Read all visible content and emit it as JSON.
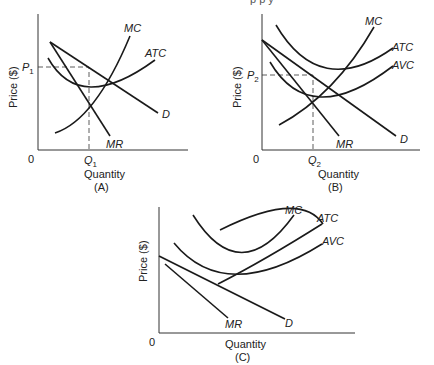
{
  "clipped_header": "p                          p y",
  "panels": [
    {
      "id": "A",
      "caption": "(A)",
      "xlabel": "Quantity",
      "ylabel": "Price ($)",
      "origin": "0",
      "price_label": "P",
      "price_sub": "1",
      "qty_label": "Q",
      "qty_sub": "1",
      "curves": {
        "mc": "MC",
        "atc": "ATC",
        "d": "D",
        "mr": "MR"
      }
    },
    {
      "id": "B",
      "caption": "(B)",
      "xlabel": "Quantity",
      "ylabel": "Price ($)",
      "origin": "0",
      "price_label": "P",
      "price_sub": "2",
      "qty_label": "Q",
      "qty_sub": "2",
      "curves": {
        "mc": "MC",
        "atc": "ATC",
        "avc": "AVC",
        "d": "D",
        "mr": "MR"
      }
    },
    {
      "id": "C",
      "caption": "(C)",
      "xlabel": "Quantity",
      "ylabel": "Price ($)",
      "origin": "0",
      "curves": {
        "mc": "MC",
        "atc": "ATC",
        "avc": "AVC",
        "d": "D",
        "mr": "MR"
      }
    }
  ]
}
